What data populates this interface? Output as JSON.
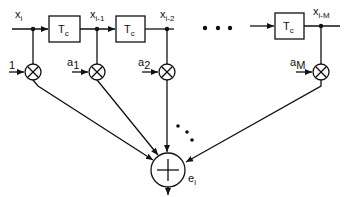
{
  "diagram": {
    "type": "transversal-filter-block-diagram",
    "input_label": "x",
    "input_sub": "i",
    "delay_label": "T",
    "delay_sub": "c",
    "taps": [
      {
        "signal": "x",
        "signal_sub": "i-1"
      },
      {
        "signal": "x",
        "signal_sub": "i-2"
      },
      {
        "signal": "x",
        "signal_sub": "i-M"
      }
    ],
    "coefficients": [
      {
        "label": "1",
        "sub": ""
      },
      {
        "label": "a",
        "sub": "1"
      },
      {
        "label": "a",
        "sub": "2"
      },
      {
        "label": "a",
        "sub": "M"
      }
    ],
    "ellipsis": "• • •",
    "output_label": "e",
    "output_sub": "i",
    "colors": {
      "stroke": "#111111",
      "background": "#ffffff"
    }
  }
}
